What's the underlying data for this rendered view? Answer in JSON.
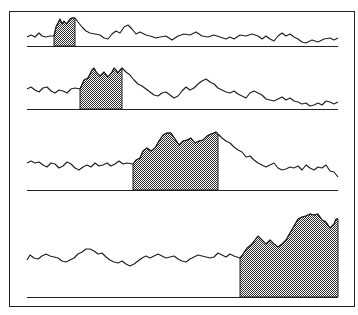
{
  "figure": {
    "frame": {
      "x": 9,
      "y": 11,
      "width": 345,
      "height": 295
    },
    "stroke_color": "#222222",
    "fill_color": "#7a7a7a",
    "background": "#ffffff",
    "panels": [
      {
        "baseline_y": 46,
        "x_start": 27,
        "x_end": 338,
        "shade_from": 54,
        "shade_to": 75,
        "points": [
          [
            27,
            37
          ],
          [
            31,
            35
          ],
          [
            35,
            37
          ],
          [
            39,
            33
          ],
          [
            42,
            36
          ],
          [
            46,
            37
          ],
          [
            50,
            36
          ],
          [
            54,
            36
          ],
          [
            56,
            27
          ],
          [
            58,
            23
          ],
          [
            60,
            19
          ],
          [
            62,
            24
          ],
          [
            64,
            21
          ],
          [
            66,
            24
          ],
          [
            68,
            22
          ],
          [
            70,
            19
          ],
          [
            72,
            18
          ],
          [
            75,
            18
          ],
          [
            78,
            22
          ],
          [
            82,
            27
          ],
          [
            86,
            31
          ],
          [
            90,
            33
          ],
          [
            95,
            34
          ],
          [
            100,
            35
          ],
          [
            104,
            38
          ],
          [
            108,
            39
          ],
          [
            112,
            34
          ],
          [
            116,
            31
          ],
          [
            120,
            33
          ],
          [
            124,
            27
          ],
          [
            128,
            25
          ],
          [
            132,
            29
          ],
          [
            136,
            34
          ],
          [
            140,
            32
          ],
          [
            146,
            35
          ],
          [
            150,
            36
          ],
          [
            156,
            38
          ],
          [
            160,
            37
          ],
          [
            166,
            36
          ],
          [
            172,
            40
          ],
          [
            178,
            36
          ],
          [
            184,
            34
          ],
          [
            190,
            35
          ],
          [
            196,
            32
          ],
          [
            202,
            36
          ],
          [
            208,
            37
          ],
          [
            214,
            35
          ],
          [
            220,
            37
          ],
          [
            226,
            39
          ],
          [
            230,
            37
          ],
          [
            234,
            39
          ],
          [
            240,
            35
          ],
          [
            246,
            36
          ],
          [
            252,
            34
          ],
          [
            258,
            36
          ],
          [
            262,
            39
          ],
          [
            266,
            36
          ],
          [
            270,
            39
          ],
          [
            274,
            41
          ],
          [
            278,
            36
          ],
          [
            282,
            33
          ],
          [
            286,
            36
          ],
          [
            290,
            34
          ],
          [
            294,
            37
          ],
          [
            298,
            39
          ],
          [
            302,
            42
          ],
          [
            306,
            43
          ],
          [
            312,
            40
          ],
          [
            318,
            42
          ],
          [
            324,
            39
          ],
          [
            330,
            38
          ],
          [
            334,
            40
          ],
          [
            338,
            38
          ]
        ]
      },
      {
        "baseline_y": 109,
        "x_start": 27,
        "x_end": 338,
        "shade_from": 80,
        "shade_to": 122,
        "points": [
          [
            27,
            89
          ],
          [
            31,
            87
          ],
          [
            35,
            90
          ],
          [
            39,
            92
          ],
          [
            43,
            88
          ],
          [
            47,
            87
          ],
          [
            51,
            91
          ],
          [
            55,
            93
          ],
          [
            59,
            90
          ],
          [
            63,
            91
          ],
          [
            67,
            93
          ],
          [
            71,
            89
          ],
          [
            75,
            88
          ],
          [
            80,
            89
          ],
          [
            84,
            80
          ],
          [
            88,
            78
          ],
          [
            92,
            70
          ],
          [
            94,
            68
          ],
          [
            96,
            72
          ],
          [
            100,
            76
          ],
          [
            104,
            72
          ],
          [
            108,
            77
          ],
          [
            112,
            72
          ],
          [
            114,
            68
          ],
          [
            116,
            70
          ],
          [
            118,
            73
          ],
          [
            120,
            70
          ],
          [
            122,
            68
          ],
          [
            126,
            72
          ],
          [
            130,
            75
          ],
          [
            134,
            80
          ],
          [
            138,
            84
          ],
          [
            142,
            86
          ],
          [
            146,
            89
          ],
          [
            150,
            92
          ],
          [
            154,
            95
          ],
          [
            158,
            96
          ],
          [
            162,
            93
          ],
          [
            166,
            92
          ],
          [
            170,
            95
          ],
          [
            174,
            98
          ],
          [
            178,
            96
          ],
          [
            182,
            91
          ],
          [
            186,
            87
          ],
          [
            190,
            90
          ],
          [
            194,
            88
          ],
          [
            198,
            84
          ],
          [
            202,
            81
          ],
          [
            206,
            79
          ],
          [
            210,
            82
          ],
          [
            214,
            84
          ],
          [
            218,
            88
          ],
          [
            222,
            90
          ],
          [
            226,
            92
          ],
          [
            230,
            93
          ],
          [
            234,
            91
          ],
          [
            238,
            94
          ],
          [
            242,
            96
          ],
          [
            246,
            98
          ],
          [
            250,
            93
          ],
          [
            254,
            91
          ],
          [
            258,
            93
          ],
          [
            262,
            95
          ],
          [
            266,
            99
          ],
          [
            270,
            100
          ],
          [
            274,
            101
          ],
          [
            278,
            99
          ],
          [
            282,
            97
          ],
          [
            286,
            100
          ],
          [
            290,
            98
          ],
          [
            294,
            101
          ],
          [
            298,
            102
          ],
          [
            302,
            104
          ],
          [
            306,
            103
          ],
          [
            310,
            106
          ],
          [
            314,
            105
          ],
          [
            318,
            103
          ],
          [
            322,
            105
          ],
          [
            326,
            101
          ],
          [
            330,
            102
          ],
          [
            334,
            104
          ],
          [
            338,
            102
          ]
        ]
      },
      {
        "baseline_y": 190,
        "x_start": 27,
        "x_end": 338,
        "shade_from": 133,
        "shade_to": 218,
        "points": [
          [
            27,
            163
          ],
          [
            31,
            161
          ],
          [
            35,
            163
          ],
          [
            39,
            162
          ],
          [
            43,
            165
          ],
          [
            47,
            167
          ],
          [
            51,
            163
          ],
          [
            55,
            164
          ],
          [
            59,
            168
          ],
          [
            63,
            166
          ],
          [
            67,
            162
          ],
          [
            71,
            164
          ],
          [
            75,
            168
          ],
          [
            79,
            170
          ],
          [
            83,
            167
          ],
          [
            87,
            165
          ],
          [
            91,
            167
          ],
          [
            95,
            163
          ],
          [
            99,
            166
          ],
          [
            103,
            165
          ],
          [
            107,
            163
          ],
          [
            111,
            166
          ],
          [
            115,
            164
          ],
          [
            119,
            161
          ],
          [
            123,
            164
          ],
          [
            127,
            163
          ],
          [
            133,
            164
          ],
          [
            136,
            160
          ],
          [
            140,
            158
          ],
          [
            143,
            151
          ],
          [
            147,
            148
          ],
          [
            151,
            151
          ],
          [
            155,
            148
          ],
          [
            159,
            141
          ],
          [
            163,
            135
          ],
          [
            167,
            133
          ],
          [
            171,
            133
          ],
          [
            175,
            139
          ],
          [
            179,
            145
          ],
          [
            183,
            141
          ],
          [
            187,
            140
          ],
          [
            191,
            138
          ],
          [
            195,
            143
          ],
          [
            199,
            141
          ],
          [
            203,
            140
          ],
          [
            207,
            136
          ],
          [
            211,
            134
          ],
          [
            214,
            133
          ],
          [
            216,
            132
          ],
          [
            218,
            134
          ],
          [
            222,
            138
          ],
          [
            226,
            141
          ],
          [
            230,
            143
          ],
          [
            234,
            147
          ],
          [
            238,
            150
          ],
          [
            242,
            152
          ],
          [
            246,
            157
          ],
          [
            250,
            156
          ],
          [
            254,
            160
          ],
          [
            258,
            163
          ],
          [
            262,
            165
          ],
          [
            266,
            167
          ],
          [
            270,
            165
          ],
          [
            274,
            163
          ],
          [
            278,
            168
          ],
          [
            282,
            170
          ],
          [
            286,
            169
          ],
          [
            290,
            167
          ],
          [
            294,
            168
          ],
          [
            298,
            166
          ],
          [
            302,
            170
          ],
          [
            306,
            165
          ],
          [
            310,
            168
          ],
          [
            314,
            170
          ],
          [
            318,
            167
          ],
          [
            322,
            168
          ],
          [
            326,
            165
          ],
          [
            330,
            171
          ],
          [
            334,
            172
          ],
          [
            338,
            177
          ]
        ]
      },
      {
        "baseline_y": 297,
        "x_start": 27,
        "x_end": 338,
        "shade_from": 240,
        "shade_to": 338,
        "points": [
          [
            27,
            260
          ],
          [
            30,
            255
          ],
          [
            34,
            258
          ],
          [
            38,
            259
          ],
          [
            42,
            256
          ],
          [
            46,
            254
          ],
          [
            50,
            256
          ],
          [
            54,
            257
          ],
          [
            58,
            258
          ],
          [
            62,
            261
          ],
          [
            66,
            262
          ],
          [
            70,
            260
          ],
          [
            74,
            258
          ],
          [
            78,
            254
          ],
          [
            82,
            252
          ],
          [
            86,
            249
          ],
          [
            90,
            249
          ],
          [
            94,
            251
          ],
          [
            98,
            254
          ],
          [
            102,
            253
          ],
          [
            106,
            257
          ],
          [
            110,
            260
          ],
          [
            114,
            262
          ],
          [
            118,
            263
          ],
          [
            122,
            261
          ],
          [
            126,
            264
          ],
          [
            130,
            266
          ],
          [
            134,
            264
          ],
          [
            138,
            261
          ],
          [
            142,
            258
          ],
          [
            146,
            256
          ],
          [
            150,
            258
          ],
          [
            154,
            256
          ],
          [
            158,
            254
          ],
          [
            162,
            256
          ],
          [
            166,
            258
          ],
          [
            170,
            257
          ],
          [
            174,
            256
          ],
          [
            178,
            259
          ],
          [
            182,
            261
          ],
          [
            186,
            262
          ],
          [
            190,
            259
          ],
          [
            194,
            257
          ],
          [
            198,
            255
          ],
          [
            202,
            256
          ],
          [
            206,
            257
          ],
          [
            210,
            258
          ],
          [
            214,
            257
          ],
          [
            218,
            253
          ],
          [
            222,
            255
          ],
          [
            226,
            257
          ],
          [
            230,
            254
          ],
          [
            234,
            256
          ],
          [
            240,
            258
          ],
          [
            243,
            254
          ],
          [
            247,
            248
          ],
          [
            251,
            245
          ],
          [
            255,
            240
          ],
          [
            258,
            236
          ],
          [
            262,
            240
          ],
          [
            266,
            244
          ],
          [
            270,
            240
          ],
          [
            274,
            244
          ],
          [
            278,
            247
          ],
          [
            282,
            244
          ],
          [
            286,
            240
          ],
          [
            290,
            233
          ],
          [
            294,
            226
          ],
          [
            298,
            219
          ],
          [
            302,
            217
          ],
          [
            306,
            216
          ],
          [
            310,
            214
          ],
          [
            314,
            215
          ],
          [
            318,
            214
          ],
          [
            322,
            220
          ],
          [
            326,
            222
          ],
          [
            330,
            228
          ],
          [
            334,
            224
          ],
          [
            336,
            219
          ],
          [
            338,
            219
          ]
        ]
      }
    ]
  }
}
